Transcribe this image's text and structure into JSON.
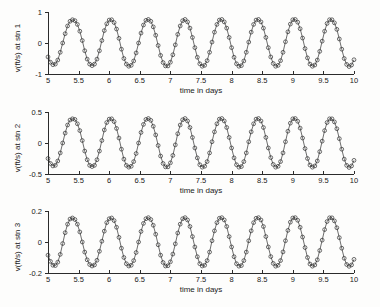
{
  "figure": {
    "background": "#fdfdfc",
    "line_color": "#2f2f2f",
    "axis_color": "#2b2b2b"
  },
  "chart_data": [
    {
      "type": "line",
      "title": "",
      "xlabel": "time in days",
      "ylabel": "v(ft/s) at stn 1",
      "xlim": [
        5,
        10
      ],
      "ylim": [
        -1,
        1
      ],
      "xticks": [
        5,
        5.5,
        6,
        6.5,
        7,
        7.5,
        8,
        8.5,
        9,
        9.5,
        10
      ],
      "xticklabels": [
        "5",
        "5.5",
        "6",
        "6.5",
        "7",
        "7.5",
        "8",
        "8.5",
        "9",
        "9.5",
        "10"
      ],
      "yticks": [
        -1,
        0,
        1
      ],
      "yticklabels": [
        "-1",
        "0",
        "1"
      ],
      "grid": false,
      "legend": "none",
      "marker": "circle",
      "amplitude": 0.75,
      "period_days": 0.517,
      "series": [
        {
          "name": "stn 1",
          "x": [
            5.0,
            5.04,
            5.08,
            5.12,
            5.16,
            5.2,
            5.24,
            5.28,
            5.32,
            5.36,
            5.4,
            5.44,
            5.48,
            5.52,
            5.56,
            5.6,
            5.64,
            5.68,
            5.72,
            5.76,
            5.8,
            5.84,
            5.88,
            5.92,
            5.96,
            6.0,
            6.04,
            6.08,
            6.12,
            6.16,
            6.2,
            6.24,
            6.28,
            6.32,
            6.36,
            6.4,
            6.44,
            6.48,
            6.52,
            6.56,
            6.6,
            6.64,
            6.68,
            6.72,
            6.76,
            6.8,
            6.84,
            6.88,
            6.92,
            6.96,
            7.0,
            7.04,
            7.08,
            7.12,
            7.16,
            7.2,
            7.24,
            7.28,
            7.32,
            7.36,
            7.4,
            7.44,
            7.48,
            7.52,
            7.56,
            7.6,
            7.64,
            7.68,
            7.72,
            7.76,
            7.8,
            7.84,
            7.88,
            7.92,
            7.96,
            8.0,
            8.04,
            8.08,
            8.12,
            8.16,
            8.2,
            8.24,
            8.28,
            8.32,
            8.36,
            8.4,
            8.44,
            8.48,
            8.52,
            8.56,
            8.6,
            8.64,
            8.68,
            8.72,
            8.76,
            8.8,
            8.84,
            8.88,
            8.92,
            8.96,
            9.0,
            9.04,
            9.08,
            9.12,
            9.16,
            9.2,
            9.24,
            9.28,
            9.32,
            9.36,
            9.4,
            9.44,
            9.48,
            9.52,
            9.56,
            9.6,
            9.64,
            9.68,
            9.72,
            9.76,
            9.8,
            9.84,
            9.88,
            9.92,
            9.96,
            10.0
          ],
          "y": [
            -0.45,
            -0.62,
            -0.7,
            -0.68,
            -0.55,
            -0.3,
            0.0,
            0.3,
            0.55,
            0.7,
            0.75,
            0.72,
            0.6,
            0.38,
            0.08,
            -0.25,
            -0.52,
            -0.68,
            -0.73,
            -0.68,
            -0.52,
            -0.25,
            0.08,
            0.4,
            0.62,
            0.74,
            0.75,
            0.66,
            0.45,
            0.15,
            -0.2,
            -0.5,
            -0.68,
            -0.75,
            -0.72,
            -0.58,
            -0.32,
            0.0,
            0.32,
            0.58,
            0.73,
            0.76,
            0.7,
            0.52,
            0.25,
            -0.08,
            -0.4,
            -0.63,
            -0.74,
            -0.74,
            -0.62,
            -0.38,
            -0.06,
            0.28,
            0.55,
            0.72,
            0.76,
            0.68,
            0.48,
            0.18,
            -0.15,
            -0.46,
            -0.67,
            -0.75,
            -0.72,
            -0.57,
            -0.3,
            0.03,
            0.35,
            0.6,
            0.74,
            0.76,
            0.68,
            0.48,
            0.18,
            -0.15,
            -0.46,
            -0.67,
            -0.75,
            -0.73,
            -0.58,
            -0.3,
            0.03,
            0.35,
            0.6,
            0.74,
            0.76,
            0.68,
            0.48,
            0.18,
            -0.15,
            -0.45,
            -0.66,
            -0.75,
            -0.72,
            -0.57,
            -0.3,
            0.04,
            0.36,
            0.61,
            0.75,
            0.76,
            0.67,
            0.46,
            0.16,
            -0.18,
            -0.48,
            -0.68,
            -0.75,
            -0.71,
            -0.55,
            -0.27,
            0.06,
            0.38,
            0.63,
            0.75,
            0.75,
            0.65,
            0.44,
            0.13,
            -0.2,
            -0.5,
            -0.69,
            -0.76,
            -0.71,
            -0.54,
            -0.25,
            0.08,
            0.4,
            0.65
          ]
        }
      ]
    },
    {
      "type": "line",
      "title": "",
      "xlabel": "time in days",
      "ylabel": "v(ft/s) at stn 2",
      "xlim": [
        5,
        10
      ],
      "ylim": [
        -0.5,
        0.5
      ],
      "xticks": [
        5,
        5.5,
        6,
        6.5,
        7,
        7.5,
        8,
        8.5,
        9,
        9.5,
        10
      ],
      "xticklabels": [
        "5",
        "5.5",
        "6",
        "6.5",
        "7",
        "7.5",
        "8",
        "8.5",
        "9",
        "9.5",
        "10"
      ],
      "yticks": [
        -0.5,
        0,
        0.5
      ],
      "yticklabels": [
        "-0.5",
        "0",
        "0.5"
      ],
      "grid": false,
      "legend": "none",
      "marker": "circle",
      "amplitude": 0.39,
      "period_days": 0.517,
      "series": [
        {
          "name": "stn 2",
          "x": [
            5.0,
            5.04,
            5.08,
            5.12,
            5.16,
            5.2,
            5.24,
            5.28,
            5.32,
            5.36,
            5.4,
            5.44,
            5.48,
            5.52,
            5.56,
            5.6,
            5.64,
            5.68,
            5.72,
            5.76,
            5.8,
            5.84,
            5.88,
            5.92,
            5.96,
            6.0,
            6.04,
            6.08,
            6.12,
            6.16,
            6.2,
            6.24,
            6.28,
            6.32,
            6.36,
            6.4,
            6.44,
            6.48,
            6.52,
            6.56,
            6.6,
            6.64,
            6.68,
            6.72,
            6.76,
            6.8,
            6.84,
            6.88,
            6.92,
            6.96,
            7.0,
            7.04,
            7.08,
            7.12,
            7.16,
            7.2,
            7.24,
            7.28,
            7.32,
            7.36,
            7.4,
            7.44,
            7.48,
            7.52,
            7.56,
            7.6,
            7.64,
            7.68,
            7.72,
            7.76,
            7.8,
            7.84,
            7.88,
            7.92,
            7.96,
            8.0,
            8.04,
            8.08,
            8.12,
            8.16,
            8.2,
            8.24,
            8.28,
            8.32,
            8.36,
            8.4,
            8.44,
            8.48,
            8.52,
            8.56,
            8.6,
            8.64,
            8.68,
            8.72,
            8.76,
            8.8,
            8.84,
            8.88,
            8.92,
            8.96,
            9.0,
            9.04,
            9.08,
            9.12,
            9.16,
            9.2,
            9.24,
            9.28,
            9.32,
            9.36,
            9.4,
            9.44,
            9.48,
            9.52,
            9.56,
            9.6,
            9.64,
            9.68,
            9.72,
            9.76,
            9.8,
            9.84,
            9.88,
            9.92,
            9.96,
            10.0
          ],
          "y": [
            -0.25,
            -0.33,
            -0.37,
            -0.36,
            -0.29,
            -0.16,
            0.0,
            0.16,
            0.29,
            0.37,
            0.39,
            0.38,
            0.31,
            0.2,
            0.04,
            -0.13,
            -0.27,
            -0.36,
            -0.38,
            -0.36,
            -0.27,
            -0.13,
            0.04,
            0.21,
            0.33,
            0.385,
            0.39,
            0.345,
            0.235,
            0.08,
            -0.1,
            -0.26,
            -0.36,
            -0.39,
            -0.375,
            -0.3,
            -0.17,
            0.0,
            0.17,
            0.3,
            0.38,
            0.395,
            0.365,
            0.27,
            0.13,
            -0.04,
            -0.21,
            -0.33,
            -0.385,
            -0.385,
            -0.32,
            -0.2,
            -0.03,
            0.15,
            0.29,
            0.375,
            0.395,
            0.355,
            0.25,
            0.09,
            -0.08,
            -0.24,
            -0.35,
            -0.39,
            -0.375,
            -0.3,
            -0.16,
            0.02,
            0.18,
            0.31,
            0.385,
            0.395,
            0.355,
            0.25,
            0.09,
            -0.08,
            -0.24,
            -0.35,
            -0.39,
            -0.38,
            -0.3,
            -0.16,
            0.02,
            0.18,
            0.31,
            0.385,
            0.395,
            0.355,
            0.25,
            0.09,
            -0.08,
            -0.235,
            -0.345,
            -0.39,
            -0.375,
            -0.3,
            -0.16,
            0.02,
            0.19,
            0.32,
            0.39,
            0.395,
            0.35,
            0.24,
            0.08,
            -0.09,
            -0.25,
            -0.355,
            -0.39,
            -0.37,
            -0.29,
            -0.14,
            0.03,
            0.2,
            0.33,
            0.39,
            0.39,
            0.34,
            0.23,
            0.07,
            -0.1,
            -0.26,
            -0.36,
            -0.395,
            -0.37,
            -0.28,
            -0.13,
            0.04,
            0.21,
            0.34
          ]
        }
      ]
    },
    {
      "type": "line",
      "title": "",
      "xlabel": "time in days",
      "ylabel": "v(ft/s) at stn 3",
      "xlim": [
        5,
        10
      ],
      "ylim": [
        -0.2,
        0.2
      ],
      "xticks": [
        5,
        5.5,
        6,
        6.5,
        7,
        7.5,
        8,
        8.5,
        9,
        9.5,
        10
      ],
      "xticklabels": [
        "5",
        "5.5",
        "6",
        "6.5",
        "7",
        "7.5",
        "8",
        "8.5",
        "9",
        "9.5",
        "10"
      ],
      "yticks": [
        -0.2,
        0,
        0.2
      ],
      "yticklabels": [
        "-0.2",
        "0",
        "0.2"
      ],
      "grid": false,
      "legend": "none",
      "marker": "circle",
      "amplitude": 0.155,
      "period_days": 0.517,
      "series": [
        {
          "name": "stn 3",
          "x": [
            5.0,
            5.04,
            5.08,
            5.12,
            5.16,
            5.2,
            5.24,
            5.28,
            5.32,
            5.36,
            5.4,
            5.44,
            5.48,
            5.52,
            5.56,
            5.6,
            5.64,
            5.68,
            5.72,
            5.76,
            5.8,
            5.84,
            5.88,
            5.92,
            5.96,
            6.0,
            6.04,
            6.08,
            6.12,
            6.16,
            6.2,
            6.24,
            6.28,
            6.32,
            6.36,
            6.4,
            6.44,
            6.48,
            6.52,
            6.56,
            6.6,
            6.64,
            6.68,
            6.72,
            6.76,
            6.8,
            6.84,
            6.88,
            6.92,
            6.96,
            7.0,
            7.04,
            7.08,
            7.12,
            7.16,
            7.2,
            7.24,
            7.28,
            7.32,
            7.36,
            7.4,
            7.44,
            7.48,
            7.52,
            7.56,
            7.6,
            7.64,
            7.68,
            7.72,
            7.76,
            7.8,
            7.84,
            7.88,
            7.92,
            7.96,
            8.0,
            8.04,
            8.08,
            8.12,
            8.16,
            8.2,
            8.24,
            8.28,
            8.32,
            8.36,
            8.4,
            8.44,
            8.48,
            8.52,
            8.56,
            8.6,
            8.64,
            8.68,
            8.72,
            8.76,
            8.8,
            8.84,
            8.88,
            8.92,
            8.96,
            9.0,
            9.04,
            9.08,
            9.12,
            9.16,
            9.2,
            9.24,
            9.28,
            9.32,
            9.36,
            9.4,
            9.44,
            9.48,
            9.52,
            9.56,
            9.6,
            9.64,
            9.68,
            9.72,
            9.76,
            9.8,
            9.84,
            9.88,
            9.92,
            9.96,
            10.0
          ],
          "y": [
            -0.085,
            -0.125,
            -0.15,
            -0.152,
            -0.13,
            -0.08,
            -0.01,
            0.06,
            0.115,
            0.148,
            0.155,
            0.145,
            0.115,
            0.065,
            0.0,
            -0.065,
            -0.115,
            -0.145,
            -0.155,
            -0.148,
            -0.118,
            -0.06,
            0.005,
            0.07,
            0.125,
            0.15,
            0.155,
            0.138,
            0.095,
            0.03,
            -0.04,
            -0.1,
            -0.14,
            -0.155,
            -0.15,
            -0.12,
            -0.068,
            0.0,
            0.068,
            0.12,
            0.15,
            0.157,
            0.145,
            0.108,
            0.05,
            -0.018,
            -0.085,
            -0.132,
            -0.155,
            -0.153,
            -0.128,
            -0.078,
            -0.012,
            0.058,
            0.115,
            0.15,
            0.157,
            0.142,
            0.1,
            0.035,
            -0.032,
            -0.095,
            -0.14,
            -0.155,
            -0.15,
            -0.12,
            -0.065,
            0.008,
            0.072,
            0.125,
            0.153,
            0.157,
            0.142,
            0.1,
            0.035,
            -0.032,
            -0.095,
            -0.14,
            -0.156,
            -0.152,
            -0.12,
            -0.065,
            0.008,
            0.072,
            0.125,
            0.153,
            0.157,
            0.142,
            0.1,
            0.035,
            -0.032,
            -0.094,
            -0.138,
            -0.156,
            -0.15,
            -0.12,
            -0.064,
            0.008,
            0.075,
            0.128,
            0.155,
            0.157,
            0.14,
            0.095,
            0.032,
            -0.036,
            -0.1,
            -0.142,
            -0.156,
            -0.148,
            -0.115,
            -0.055,
            0.012,
            0.08,
            0.132,
            0.156,
            0.156,
            0.136,
            0.092,
            0.028,
            -0.04,
            -0.105,
            -0.145,
            -0.157,
            -0.148,
            -0.112,
            -0.052,
            0.016,
            0.085,
            0.135
          ]
        }
      ]
    }
  ]
}
